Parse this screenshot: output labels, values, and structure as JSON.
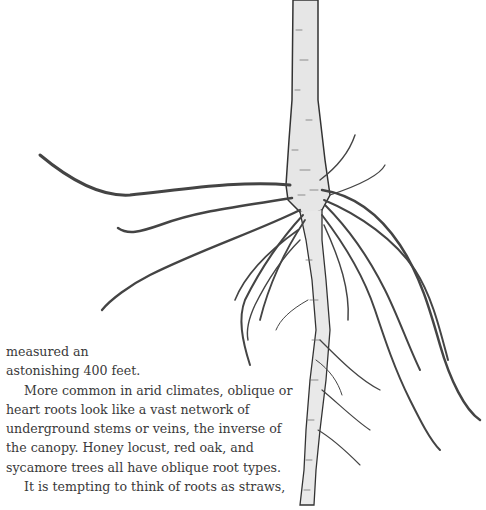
{
  "illustration": {
    "subject": "tree-root-system",
    "description": "Pen-and-ink drawing of a tree trunk with spreading oblique roots"
  },
  "text": {
    "p1_line1": "measured an",
    "p1_line2": "astonishing 400 feet.",
    "p2": "More common in arid climates, oblique or heart roots look like a vast network of underground stems or veins, the inverse of the canopy. Honey locust, red oak, and sycamore trees all have oblique root types.",
    "p3": "It is tempting to think of roots as straws,"
  }
}
